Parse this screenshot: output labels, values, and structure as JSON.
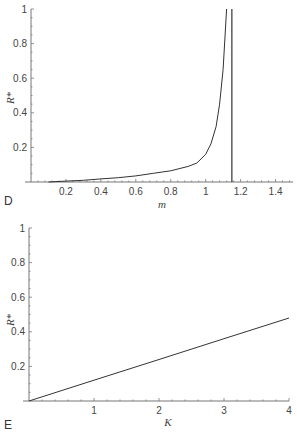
{
  "chart_data": [
    {
      "panel": "D",
      "type": "line",
      "title": "",
      "xlabel": "m",
      "ylabel": "R*",
      "xlim": [
        0,
        1.5
      ],
      "ylim": [
        0,
        1
      ],
      "xticks": [
        "0.2",
        "0.4",
        "0.6",
        "0.8",
        "1",
        "1.2",
        "1.4"
      ],
      "yticks": [
        "0.2",
        "0.4",
        "0.6",
        "0.8",
        "1"
      ],
      "grid": false,
      "series": [
        {
          "name": "R*(m)",
          "x": [
            0.1,
            0.2,
            0.3,
            0.4,
            0.5,
            0.6,
            0.7,
            0.8,
            0.9,
            0.95,
            1.0,
            1.03,
            1.06,
            1.08,
            1.1,
            1.12
          ],
          "values": [
            0.0,
            0.005,
            0.01,
            0.018,
            0.025,
            0.035,
            0.05,
            0.065,
            0.09,
            0.11,
            0.16,
            0.22,
            0.32,
            0.45,
            0.65,
            1.0
          ]
        }
      ],
      "annotations": [
        {
          "type": "vertical-asymptote",
          "x": 1.15
        }
      ]
    },
    {
      "panel": "E",
      "type": "line",
      "title": "",
      "xlabel": "K",
      "ylabel": "R*",
      "xlim": [
        0,
        4
      ],
      "ylim": [
        0,
        1
      ],
      "xticks": [
        "1",
        "2",
        "3",
        "4"
      ],
      "yticks": [
        "0.2",
        "0.4",
        "0.6",
        "0.8",
        "1"
      ],
      "grid": false,
      "series": [
        {
          "name": "R*(K)",
          "x": [
            0,
            1,
            2,
            3,
            4
          ],
          "values": [
            0.0,
            0.12,
            0.24,
            0.36,
            0.48
          ]
        }
      ]
    }
  ],
  "labels": {
    "panelD": "D",
    "panelE": "E",
    "xlabelD": "m",
    "xlabelE": "K",
    "ylabel": "R*"
  }
}
